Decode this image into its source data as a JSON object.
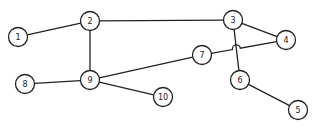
{
  "diagram": {
    "type": "undirected-graph",
    "nodes": [
      {
        "id": "1",
        "label": "1",
        "x": 18,
        "y": 37
      },
      {
        "id": "2",
        "label": "2",
        "x": 90,
        "y": 21
      },
      {
        "id": "3",
        "label": "3",
        "x": 233,
        "y": 20
      },
      {
        "id": "4",
        "label": "4",
        "x": 286,
        "y": 40
      },
      {
        "id": "5",
        "label": "5",
        "x": 298,
        "y": 110
      },
      {
        "id": "6",
        "label": "6",
        "x": 240,
        "y": 80
      },
      {
        "id": "7",
        "label": "7",
        "x": 202,
        "y": 55
      },
      {
        "id": "8",
        "label": "8",
        "x": 25,
        "y": 84
      },
      {
        "id": "9",
        "label": "9",
        "x": 90,
        "y": 80
      },
      {
        "id": "10",
        "label": "10",
        "x": 163,
        "y": 97
      }
    ],
    "edges": [
      [
        "1",
        "2"
      ],
      [
        "2",
        "3"
      ],
      [
        "2",
        "9"
      ],
      [
        "3",
        "4"
      ],
      [
        "3",
        "6"
      ],
      [
        "6",
        "5"
      ],
      [
        "7",
        "4"
      ],
      [
        "9",
        "7"
      ],
      [
        "9",
        "8"
      ],
      [
        "9",
        "10"
      ]
    ],
    "crossings": [
      {
        "edge": [
          "7",
          "4"
        ],
        "over": [
          "3",
          "6"
        ],
        "style": "hop"
      }
    ]
  }
}
